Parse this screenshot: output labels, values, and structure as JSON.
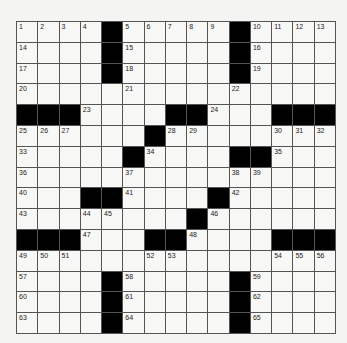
{
  "puzzle": {
    "rows": 15,
    "cols": 15,
    "grid": [
      "....#.....#....",
      "....#.....#....",
      "....#.....#....",
      "...............",
      "###....##...###",
      "......#........",
      ".....#....##...",
      "...............",
      "...##....#.....",
      "........#......",
      "###...##....###",
      "...............",
      "....#.....#....",
      "....#.....#....",
      "....#.....#...."
    ],
    "numbers": [
      [
        0,
        0,
        1
      ],
      [
        0,
        1,
        2
      ],
      [
        0,
        2,
        3
      ],
      [
        0,
        3,
        4
      ],
      [
        0,
        5,
        5
      ],
      [
        0,
        6,
        6
      ],
      [
        0,
        7,
        7
      ],
      [
        0,
        8,
        8
      ],
      [
        0,
        9,
        9
      ],
      [
        0,
        11,
        10
      ],
      [
        0,
        12,
        11
      ],
      [
        0,
        13,
        12
      ],
      [
        0,
        14,
        13
      ],
      [
        1,
        0,
        14
      ],
      [
        1,
        5,
        15
      ],
      [
        1,
        11,
        16
      ],
      [
        2,
        0,
        17
      ],
      [
        2,
        5,
        18
      ],
      [
        2,
        11,
        19
      ],
      [
        3,
        0,
        20
      ],
      [
        3,
        5,
        21
      ],
      [
        3,
        10,
        22
      ],
      [
        4,
        3,
        23
      ],
      [
        4,
        9,
        24
      ],
      [
        5,
        0,
        25
      ],
      [
        5,
        1,
        26
      ],
      [
        5,
        2,
        27
      ],
      [
        5,
        7,
        28
      ],
      [
        5,
        8,
        29
      ],
      [
        5,
        12,
        30
      ],
      [
        5,
        13,
        31
      ],
      [
        5,
        14,
        32
      ],
      [
        6,
        0,
        33
      ],
      [
        6,
        6,
        34
      ],
      [
        6,
        12,
        35
      ],
      [
        7,
        0,
        36
      ],
      [
        7,
        5,
        37
      ],
      [
        7,
        10,
        38
      ],
      [
        7,
        11,
        39
      ],
      [
        8,
        0,
        40
      ],
      [
        8,
        5,
        41
      ],
      [
        8,
        10,
        42
      ],
      [
        9,
        0,
        43
      ],
      [
        9,
        3,
        44
      ],
      [
        9,
        4,
        45
      ],
      [
        9,
        9,
        46
      ],
      [
        10,
        3,
        47
      ],
      [
        10,
        8,
        48
      ],
      [
        11,
        0,
        49
      ],
      [
        11,
        1,
        50
      ],
      [
        11,
        2,
        51
      ],
      [
        11,
        6,
        52
      ],
      [
        11,
        7,
        53
      ],
      [
        11,
        12,
        54
      ],
      [
        11,
        13,
        55
      ],
      [
        11,
        14,
        56
      ],
      [
        12,
        0,
        57
      ],
      [
        12,
        5,
        58
      ],
      [
        12,
        11,
        59
      ],
      [
        13,
        0,
        60
      ],
      [
        13,
        5,
        61
      ],
      [
        13,
        11,
        62
      ],
      [
        14,
        0,
        63
      ],
      [
        14,
        5,
        64
      ],
      [
        14,
        11,
        65
      ]
    ]
  }
}
